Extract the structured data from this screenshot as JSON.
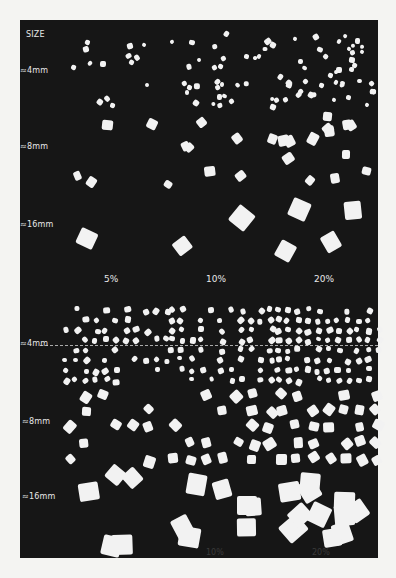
{
  "figure": {
    "background": "#161616",
    "particle_color": "#f2f2f2",
    "top": {
      "size_header": "SIZE",
      "size_labels": [
        "≈4mm",
        "≈8mm",
        "≈16mm"
      ],
      "concentration_labels": [
        "5%",
        "10%",
        "20%"
      ]
    },
    "bottom": {
      "size_labels": [
        "≈4mm",
        "≈8mm",
        "≈16mm"
      ],
      "concentration_labels": [
        "5%",
        "10%",
        "20%"
      ]
    }
  }
}
